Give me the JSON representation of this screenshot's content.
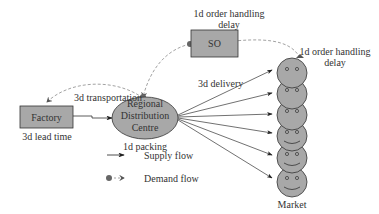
{
  "nodes": {
    "factory": {
      "label": "Factory",
      "sublabel": "3d lead time"
    },
    "rdc": {
      "line1": "Regional",
      "line2": "Distribution",
      "line3": "Centre",
      "sublabel": "1d packing"
    },
    "so": {
      "label": "SO",
      "toplabel_1": "1d order handling",
      "toplabel_2": "delay"
    },
    "market": {
      "label": "Market",
      "customer_count": 6
    }
  },
  "edges": {
    "transport_label": "3d transportation",
    "delivery_label": "3d delivery",
    "market_delay_1": "1d order handling",
    "market_delay_2": "delay"
  },
  "legend": {
    "supply": "Supply flow",
    "demand": "Demand flow"
  },
  "colors": {
    "fill": "#a8a8a8",
    "stroke": "#333333",
    "demand_line": "#8a8a8a",
    "dot": "#666666"
  }
}
